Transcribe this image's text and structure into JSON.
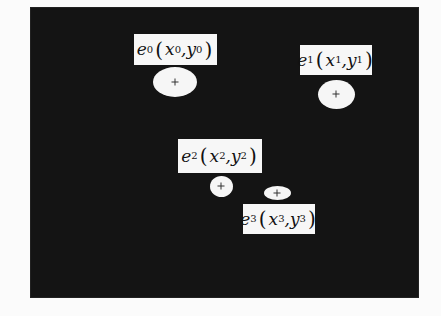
{
  "figure": {
    "background_color": "#141414",
    "foreground_color": "#f6f6f6"
  },
  "objects": [
    {
      "id": "e0",
      "name": "e",
      "index": "0",
      "x_sym": "x",
      "y_sym": "y",
      "label_text": "e0(x0, y0)",
      "blob": {
        "cx": 175,
        "cy": 82,
        "w": 44,
        "h": 30
      },
      "label_box": {
        "x": 134,
        "y": 34,
        "w": 83,
        "h": 31
      }
    },
    {
      "id": "e1",
      "name": "e",
      "index": "1",
      "x_sym": "x",
      "y_sym": "y",
      "label_text": "e1(x1, y1)",
      "blob": {
        "cx": 336,
        "cy": 94,
        "w": 37,
        "h": 29
      },
      "label_box": {
        "x": 300,
        "y": 45,
        "w": 72,
        "h": 30
      }
    },
    {
      "id": "e2",
      "name": "e",
      "index": "2",
      "x_sym": "x",
      "y_sym": "y",
      "label_text": "e2(x2, y2)",
      "blob": {
        "cx": 221,
        "cy": 186,
        "w": 23,
        "h": 21
      },
      "label_box": {
        "x": 178,
        "y": 139,
        "w": 84,
        "h": 34
      }
    },
    {
      "id": "e3",
      "name": "e",
      "index": "3",
      "x_sym": "x",
      "y_sym": "y",
      "label_text": "e3(x3, y3)",
      "blob": {
        "cx": 277,
        "cy": 193,
        "w": 27,
        "h": 14
      },
      "label_box": {
        "x": 243,
        "y": 204,
        "w": 72,
        "h": 30
      }
    }
  ],
  "labels": {
    "open_paren": "(",
    "close_paren": ")",
    "comma": ", "
  }
}
